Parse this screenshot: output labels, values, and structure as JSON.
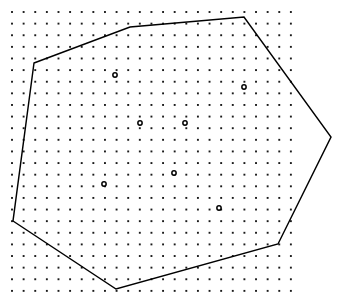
{
  "figure": {
    "width": 353,
    "height": 307,
    "background_color": "#ffffff"
  },
  "chart_data": {
    "type": "scatter",
    "subtitle": "",
    "xlabel": "",
    "ylabel": "",
    "xlim": [
      0,
      353
    ],
    "ylim": [
      307,
      0
    ],
    "grid": true,
    "legend": null,
    "annotations": [],
    "lattice": {
      "name": "background dot lattice",
      "marker": "filled square dot",
      "color": "#1a1a1a",
      "dot_size": 1.9,
      "origin_x": 12,
      "origin_y": 12,
      "spacing_x": 11.62,
      "spacing_y": 11.62,
      "columns": 25,
      "rows": 25,
      "count": 625
    },
    "series": [
      {
        "name": "interior sites",
        "marker": "open circle",
        "marker_size": 4.3,
        "fill_color": "#ffffff",
        "edge_color": "#000000",
        "count": 7,
        "points": [
          {
            "label": "s1",
            "x": 115,
            "y": 75
          },
          {
            "label": "s2",
            "x": 244,
            "y": 87
          },
          {
            "label": "s3",
            "x": 140,
            "y": 123
          },
          {
            "label": "s4",
            "x": 185,
            "y": 123
          },
          {
            "label": "s5",
            "x": 174,
            "y": 173
          },
          {
            "label": "s6",
            "x": 104,
            "y": 184
          },
          {
            "label": "s7",
            "x": 219,
            "y": 208
          }
        ]
      }
    ],
    "hull": {
      "name": "convex hull polygon",
      "closed": true,
      "sides": 7,
      "stroke_color": "#000000",
      "stroke_width": 1.45,
      "fill": "none",
      "vertices": [
        {
          "label": "v1",
          "x": 34,
          "y": 63
        },
        {
          "label": "v2",
          "x": 130,
          "y": 27
        },
        {
          "label": "v3",
          "x": 244,
          "y": 17
        },
        {
          "label": "v4",
          "x": 331,
          "y": 137
        },
        {
          "label": "v5",
          "x": 278,
          "y": 244
        },
        {
          "label": "v6",
          "x": 116,
          "y": 289
        },
        {
          "label": "v7",
          "x": 13,
          "y": 221
        }
      ]
    }
  }
}
